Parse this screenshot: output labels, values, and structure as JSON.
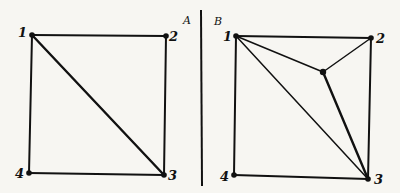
{
  "panels": [
    {
      "id": "A",
      "label": "A",
      "vertices": [
        {
          "label": "1",
          "x": 32,
          "y": 35
        },
        {
          "label": "2",
          "x": 166,
          "y": 36
        },
        {
          "label": "3",
          "x": 164,
          "y": 175
        },
        {
          "label": "4",
          "x": 29,
          "y": 173
        }
      ],
      "edges": [
        [
          "1",
          "2"
        ],
        [
          "2",
          "3"
        ],
        [
          "3",
          "4"
        ],
        [
          "4",
          "1"
        ],
        [
          "1",
          "3"
        ]
      ]
    },
    {
      "id": "B",
      "label": "B",
      "vertices": [
        {
          "label": "1",
          "x": 236,
          "y": 36
        },
        {
          "label": "2",
          "x": 371,
          "y": 38
        },
        {
          "label": "3",
          "x": 368,
          "y": 179
        },
        {
          "label": "4",
          "x": 234,
          "y": 175
        },
        {
          "label": "",
          "x": 323,
          "y": 72
        }
      ],
      "edges": [
        [
          "1",
          "2"
        ],
        [
          "2",
          "3"
        ],
        [
          "3",
          "4"
        ],
        [
          "4",
          "1"
        ],
        [
          "1",
          "3"
        ],
        [
          "1",
          "center"
        ],
        [
          "2",
          "center"
        ],
        [
          "3",
          "center"
        ]
      ]
    }
  ],
  "colors": {
    "ink": "#111111",
    "paper": "#f7f6f2"
  }
}
